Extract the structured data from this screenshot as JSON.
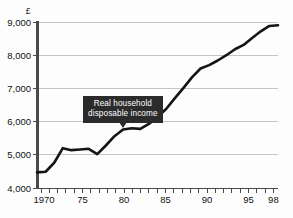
{
  "chart_data": {
    "type": "line",
    "title": "",
    "subtitle": "",
    "xlabel": "",
    "ylabel": "",
    "y_unit_symbol": "£",
    "xlim": [
      1970,
      1998
    ],
    "ylim": [
      4000,
      9000
    ],
    "grid": true,
    "grid_axis": "y",
    "legend_position": "none",
    "y_ticks": [
      4000,
      5000,
      6000,
      7000,
      8000,
      9000
    ],
    "y_tick_labels": [
      "4,000",
      "5,000",
      "6,000",
      "7,000",
      "8,000",
      "9,000"
    ],
    "x_ticks": [
      1970,
      1971,
      1972,
      1973,
      1974,
      1975,
      1976,
      1977,
      1978,
      1979,
      1980,
      1981,
      1982,
      1983,
      1984,
      1985,
      1986,
      1987,
      1988,
      1989,
      1990,
      1991,
      1992,
      1993,
      1994,
      1995,
      1996,
      1997,
      1998
    ],
    "x_tick_labels": [
      {
        "x": 1970,
        "label": "1970"
      },
      {
        "x": 1975,
        "label": "75"
      },
      {
        "x": 1980,
        "label": "80"
      },
      {
        "x": 1985,
        "label": "85"
      },
      {
        "x": 1990,
        "label": "90"
      },
      {
        "x": 1995,
        "label": "95"
      },
      {
        "x": 1998,
        "label": "98"
      }
    ],
    "series": [
      {
        "name": "Real household disposable income",
        "color": "#141414",
        "x": [
          1970,
          1971,
          1972,
          1973,
          1974,
          1975,
          1976,
          1977,
          1978,
          1979,
          1980,
          1981,
          1982,
          1983,
          1984,
          1985,
          1986,
          1987,
          1988,
          1989,
          1990,
          1991,
          1992,
          1993,
          1994,
          1995,
          1996,
          1997,
          1998
        ],
        "values": [
          4470,
          4490,
          4760,
          5200,
          5140,
          5160,
          5180,
          5020,
          5280,
          5560,
          5760,
          5800,
          5780,
          5930,
          6140,
          6380,
          6700,
          7010,
          7330,
          7600,
          7700,
          7840,
          8000,
          8180,
          8310,
          8520,
          8720,
          8880,
          8900
        ]
      }
    ],
    "annotations": [
      {
        "id": "series-callout",
        "line_1": "Real household",
        "line_2": "disposable income",
        "background_color": "#2b2b2b",
        "text_color": "#ffffff",
        "points_to_x": 1980,
        "points_to_y": 5760
      }
    ],
    "colors": {
      "grid": "#bfbfbf",
      "axis": "#4a4a4a",
      "plot_background": "#fdfdfd",
      "text": "#111111"
    }
  }
}
